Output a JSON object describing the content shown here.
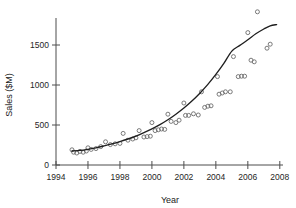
{
  "chart_data": {
    "type": "scatter",
    "title": "",
    "xlabel": "Year",
    "ylabel": "Sales ($M)",
    "xlim": [
      1994,
      2008.2
    ],
    "ylim": [
      0,
      1850
    ],
    "grid": false,
    "legend": null,
    "x_ticks": [
      1994,
      1996,
      1998,
      2000,
      2002,
      2004,
      2006,
      2008
    ],
    "x_tick_labels": [
      "1994",
      "1996",
      "1998",
      "2000",
      "2002",
      "2004",
      "2006",
      "2008"
    ],
    "y_ticks": [
      0,
      500,
      1000,
      1500
    ],
    "y_tick_labels": [
      "0",
      "500",
      "1000",
      "1500"
    ],
    "marker": "open-circle",
    "marker_color": "#6b6b6b",
    "line_color": "#1f1f1f",
    "series": [
      {
        "name": "Observed sales",
        "type": "scatter",
        "points": [
          [
            1995.0,
            190
          ],
          [
            1995.1,
            160
          ],
          [
            1995.3,
            150
          ],
          [
            1995.5,
            170
          ],
          [
            1995.7,
            160
          ],
          [
            1995.9,
            175
          ],
          [
            1996.0,
            215
          ],
          [
            1996.2,
            195
          ],
          [
            1996.5,
            205
          ],
          [
            1996.8,
            230
          ],
          [
            1997.1,
            290
          ],
          [
            1997.4,
            255
          ],
          [
            1997.7,
            265
          ],
          [
            1998.0,
            270
          ],
          [
            1998.2,
            395
          ],
          [
            1998.5,
            310
          ],
          [
            1998.8,
            325
          ],
          [
            1999.0,
            340
          ],
          [
            1999.2,
            430
          ],
          [
            1999.5,
            350
          ],
          [
            1999.7,
            355
          ],
          [
            1999.9,
            360
          ],
          [
            2000.0,
            530
          ],
          [
            2000.2,
            430
          ],
          [
            2000.4,
            440
          ],
          [
            2000.6,
            450
          ],
          [
            2000.8,
            445
          ],
          [
            2001.0,
            635
          ],
          [
            2001.2,
            545
          ],
          [
            2001.5,
            530
          ],
          [
            2001.7,
            560
          ],
          [
            2002.0,
            775
          ],
          [
            2002.1,
            620
          ],
          [
            2002.3,
            620
          ],
          [
            2002.6,
            640
          ],
          [
            2002.9,
            625
          ],
          [
            2003.1,
            915
          ],
          [
            2003.3,
            720
          ],
          [
            2003.5,
            735
          ],
          [
            2003.7,
            740
          ],
          [
            2004.1,
            1105
          ],
          [
            2004.2,
            885
          ],
          [
            2004.4,
            900
          ],
          [
            2004.6,
            915
          ],
          [
            2004.9,
            915
          ],
          [
            2005.1,
            1355
          ],
          [
            2005.4,
            1105
          ],
          [
            2005.6,
            1110
          ],
          [
            2005.8,
            1110
          ],
          [
            2006.0,
            1655
          ],
          [
            2006.2,
            1310
          ],
          [
            2006.4,
            1290
          ],
          [
            2006.6,
            1915
          ],
          [
            2007.2,
            1460
          ],
          [
            2007.4,
            1510
          ]
        ]
      },
      {
        "name": "Fitted exponential trend",
        "type": "line",
        "points": [
          [
            1995.0,
            175
          ],
          [
            1995.5,
            182
          ],
          [
            1996.0,
            196
          ],
          [
            1996.5,
            215
          ],
          [
            1997.0,
            238
          ],
          [
            1997.5,
            263
          ],
          [
            1998.0,
            292
          ],
          [
            1998.5,
            325
          ],
          [
            1999.0,
            362
          ],
          [
            1999.5,
            405
          ],
          [
            2000.0,
            452
          ],
          [
            2000.5,
            505
          ],
          [
            2001.0,
            566
          ],
          [
            2001.5,
            635
          ],
          [
            2002.0,
            712
          ],
          [
            2002.5,
            800
          ],
          [
            2003.0,
            898
          ],
          [
            2003.5,
            1008
          ],
          [
            2004.0,
            1132
          ],
          [
            2004.5,
            1270
          ],
          [
            2005.0,
            1424
          ],
          [
            2005.5,
            1495
          ],
          [
            2006.0,
            1565
          ],
          [
            2006.5,
            1640
          ],
          [
            2007.0,
            1700
          ],
          [
            2007.4,
            1740
          ],
          [
            2007.8,
            1755
          ]
        ]
      }
    ]
  }
}
